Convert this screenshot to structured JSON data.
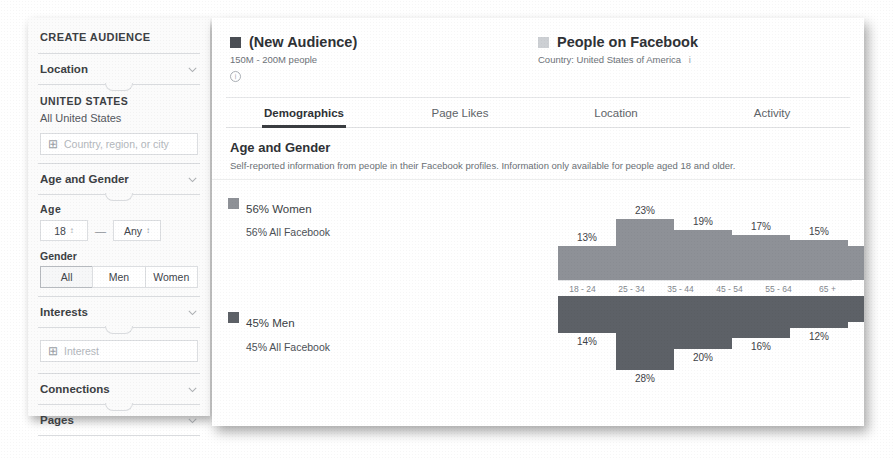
{
  "sidebar": {
    "title": "CREATE AUDIENCE",
    "sections": [
      {
        "label": "Location",
        "icon": "chevron-down-icon"
      },
      {
        "label": "Age and Gender",
        "icon": "chevron-down-icon"
      },
      {
        "label": "Interests",
        "icon": "chevron-down-icon"
      },
      {
        "label": "Connections",
        "icon": "chevron-down-icon"
      },
      {
        "label": "Pages",
        "icon": "chevron-down-icon"
      }
    ],
    "location": {
      "caption": "UNITED STATES",
      "selected": "All United States",
      "input_placeholder": "Country, region, or city",
      "add_icon": "plus-icon"
    },
    "age": {
      "label": "Age",
      "min": "18",
      "max": "Any",
      "separator": "—"
    },
    "gender": {
      "label": "Gender",
      "options": [
        "All",
        "Men",
        "Women"
      ],
      "selected": "All"
    },
    "interests": {
      "input_placeholder": "Interest",
      "add_icon": "plus-icon"
    }
  },
  "header": {
    "audience": {
      "name": "(New Audience)",
      "reach": "150M - 200M people",
      "swatch_color": "#4a4e54",
      "info_icon": "info-icon",
      "info_glyph": "i"
    },
    "comparison": {
      "name": "People on Facebook",
      "detail": "Country: United States of America",
      "swatch_color": "#cdd0d4",
      "info_glyph": "i"
    }
  },
  "tabs": [
    {
      "label": "Demographics",
      "active": true
    },
    {
      "label": "Page Likes",
      "active": false
    },
    {
      "label": "Location",
      "active": false
    },
    {
      "label": "Activity",
      "active": false
    }
  ],
  "section": {
    "heading": "Age and Gender",
    "description": "Self-reported information from people in their Facebook profiles. Information only available for people aged 18 and older."
  },
  "chart_data": {
    "type": "bar",
    "title": "Age and Gender",
    "xlabel": "",
    "ylabel": "",
    "ylim": [
      0,
      30
    ],
    "grid": false,
    "legend_position": "left",
    "categories": [
      "18 - 24",
      "25 - 34",
      "35 - 44",
      "45 - 54",
      "55 - 64",
      "65 +"
    ],
    "series": [
      {
        "name": "56% Women",
        "sublabel": "56% All Facebook",
        "color": "#8e9197",
        "values": [
          13,
          23,
          19,
          17,
          15,
          13
        ],
        "value_labels": [
          "13%",
          "23%",
          "19%",
          "17%",
          "15%",
          "13%"
        ],
        "direction": "up"
      },
      {
        "name": "45% Men",
        "sublabel": "45% All Facebook",
        "color": "#5d6167",
        "values": [
          14,
          28,
          20,
          16,
          12,
          10
        ],
        "value_labels": [
          "14%",
          "28%",
          "20%",
          "16%",
          "12%",
          "10%"
        ],
        "direction": "down"
      }
    ]
  }
}
